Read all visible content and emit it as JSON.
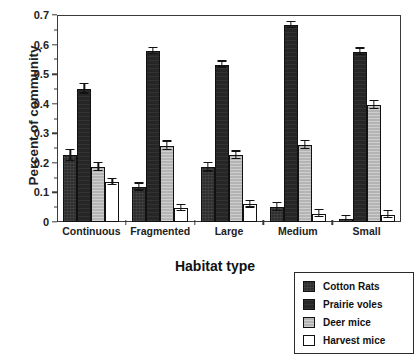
{
  "chart_data": {
    "type": "bar",
    "title": "",
    "xlabel": "Habitat type",
    "ylabel": "Percent of community",
    "categories": [
      "Continuous",
      "Fragmented",
      "Large",
      "Medium",
      "Small"
    ],
    "ylim": [
      0,
      0.7
    ],
    "ytick_labels": [
      "0",
      "0.1",
      "0.2",
      "0.3",
      "0.4",
      "0.5",
      "0.6",
      "0.7"
    ],
    "ytick_values": [
      0,
      0.1,
      0.2,
      0.3,
      0.4,
      0.5,
      0.6,
      0.7
    ],
    "ytick_minor_values": [
      0.05,
      0.15,
      0.25,
      0.35,
      0.45,
      0.55,
      0.65
    ],
    "grid": false,
    "legend_position": "outside-bottom-right",
    "series": [
      {
        "name": "Cotton Rats",
        "swatch": "solid-black",
        "color": "#2e2e2e",
        "values": [
          0.225,
          0.118,
          0.185,
          0.05,
          0.01
        ],
        "errors": [
          0.018,
          0.012,
          0.015,
          0.013,
          0.01
        ]
      },
      {
        "name": "Prairie voles",
        "swatch": "solid-black",
        "color": "#262626",
        "values": [
          0.45,
          0.578,
          0.532,
          0.665,
          0.575
        ],
        "errors": [
          0.016,
          0.01,
          0.01,
          0.01,
          0.011
        ]
      },
      {
        "name": "Deer mice",
        "swatch": "textured-gray",
        "color": "#b4b4b4",
        "values": [
          0.185,
          0.258,
          0.225,
          0.26,
          0.395
        ],
        "errors": [
          0.014,
          0.014,
          0.013,
          0.013,
          0.013
        ]
      },
      {
        "name": "Harvest mice",
        "swatch": "open-white",
        "color": "#ffffff",
        "values": [
          0.135,
          0.047,
          0.06,
          0.028,
          0.025
        ]
      }
    ]
  },
  "axes": {
    "y_title": "Percent of community",
    "x_title": "Habitat type"
  },
  "legend": {
    "items": [
      {
        "label": "Cotton Rats"
      },
      {
        "label": "Prairie voles"
      },
      {
        "label": "Deer mice"
      },
      {
        "label": "Harvest mice"
      }
    ]
  }
}
